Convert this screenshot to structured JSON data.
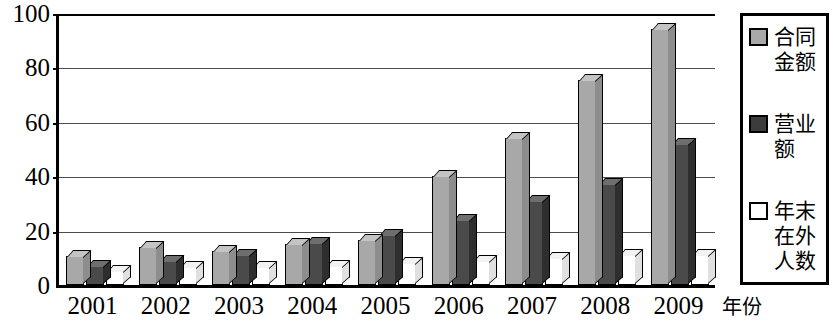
{
  "chart_data": {
    "type": "bar",
    "title": "",
    "subtitle": "",
    "xlabel": "年份",
    "ylabel": "",
    "ylim": [
      0,
      100
    ],
    "yticks": [
      0,
      20,
      40,
      60,
      80,
      100
    ],
    "grid": true,
    "legend_position": "right",
    "categories": [
      "2001",
      "2002",
      "2003",
      "2004",
      "2005",
      "2006",
      "2007",
      "2008",
      "2009"
    ],
    "series": [
      {
        "name": "合同金额",
        "color": "#a8a8a8",
        "values": [
          10.5,
          14,
          12.5,
          15,
          16.5,
          40,
          54,
          75.5,
          94
        ]
      },
      {
        "name": "营业额",
        "color": "#3c3c3c",
        "values": [
          7,
          9,
          11,
          15.5,
          18.5,
          24,
          31,
          37,
          52
        ]
      },
      {
        "name": "年末在外人数",
        "color": "#ffffff",
        "values": [
          5,
          6.5,
          6.5,
          7,
          8,
          9,
          10,
          11,
          11
        ]
      }
    ]
  },
  "axes": {
    "y_tick_labels": [
      "100",
      "80",
      "60",
      "40",
      "20",
      "0"
    ],
    "x_tick_labels": [
      "2001",
      "2002",
      "2003",
      "2004",
      "2005",
      "2006",
      "2007",
      "2008",
      "2009"
    ],
    "x_axis_title": "年份"
  },
  "legend": {
    "entries": [
      {
        "label": "合同金额",
        "swatch": "light-gray-swatch-icon"
      },
      {
        "label": "营业额",
        "swatch": "dark-gray-swatch-icon"
      },
      {
        "label": "年末在外人数",
        "swatch": "white-swatch-icon"
      }
    ]
  }
}
